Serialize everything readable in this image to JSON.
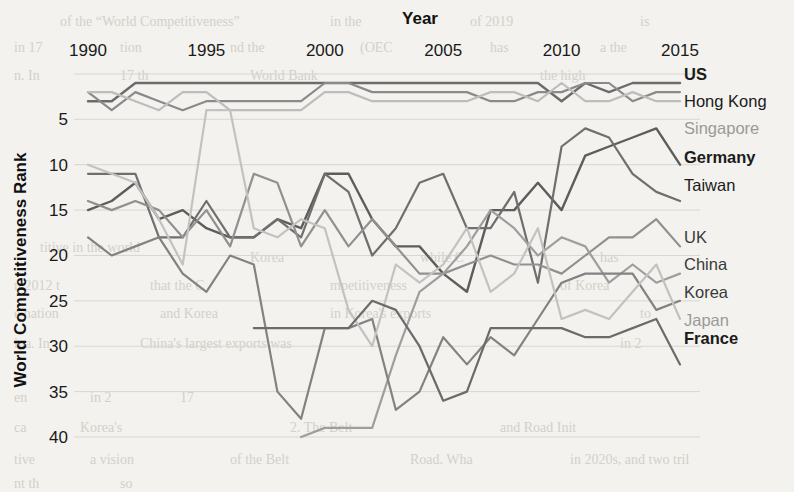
{
  "page": {
    "background_color": "#f3f2ee",
    "bleed_text": [
      {
        "text": "of the “World Competitiveness”",
        "x": 60,
        "y": 14,
        "size": 14
      },
      {
        "text": "in the",
        "x": 330,
        "y": 14,
        "size": 14
      },
      {
        "text": "of 2019",
        "x": 470,
        "y": 14,
        "size": 14
      },
      {
        "text": "is",
        "x": 640,
        "y": 14,
        "size": 14
      },
      {
        "text": "in 17",
        "x": 14,
        "y": 40,
        "size": 14
      },
      {
        "text": "tion",
        "x": 120,
        "y": 40,
        "size": 14
      },
      {
        "text": "nd the",
        "x": 230,
        "y": 40,
        "size": 14
      },
      {
        "text": "(OEC",
        "x": 360,
        "y": 40,
        "size": 14
      },
      {
        "text": "has",
        "x": 490,
        "y": 40,
        "size": 14
      },
      {
        "text": "a the",
        "x": 600,
        "y": 40,
        "size": 14
      },
      {
        "text": "n. In",
        "x": 14,
        "y": 68,
        "size": 14
      },
      {
        "text": "17 th",
        "x": 120,
        "y": 68,
        "size": 14
      },
      {
        "text": "World Bank",
        "x": 250,
        "y": 68,
        "size": 14
      },
      {
        "text": "the high",
        "x": 540,
        "y": 68,
        "size": 14
      },
      {
        "text": "titive in the world",
        "x": 40,
        "y": 240,
        "size": 14
      },
      {
        "text": "Korea",
        "x": 250,
        "y": 250,
        "size": 14
      },
      {
        "text": "while C",
        "x": 420,
        "y": 250,
        "size": 14
      },
      {
        "text": "has",
        "x": 600,
        "y": 250,
        "size": 14
      },
      {
        "text": "n 2012 t",
        "x": 14,
        "y": 278,
        "size": 14
      },
      {
        "text": "that the C",
        "x": 150,
        "y": 278,
        "size": 14
      },
      {
        "text": "mpetitiveness",
        "x": 330,
        "y": 278,
        "size": 14
      },
      {
        "text": "of Korea",
        "x": 560,
        "y": 278,
        "size": 14
      },
      {
        "text": "e nation",
        "x": 14,
        "y": 306,
        "size": 14
      },
      {
        "text": "and Korea",
        "x": 160,
        "y": 306,
        "size": 14
      },
      {
        "text": "in Korea's exports",
        "x": 330,
        "y": 306,
        "size": 14
      },
      {
        "text": "to",
        "x": 640,
        "y": 306,
        "size": 14
      },
      {
        "text": "ina. In",
        "x": 14,
        "y": 336,
        "size": 14
      },
      {
        "text": "China's largest exports was",
        "x": 140,
        "y": 336,
        "size": 14
      },
      {
        "text": "in 2",
        "x": 620,
        "y": 336,
        "size": 14
      },
      {
        "text": "en",
        "x": 14,
        "y": 390,
        "size": 14
      },
      {
        "text": "in 2",
        "x": 90,
        "y": 390,
        "size": 14
      },
      {
        "text": "17",
        "x": 180,
        "y": 390,
        "size": 14
      },
      {
        "text": "ca",
        "x": 14,
        "y": 420,
        "size": 14
      },
      {
        "text": "Korea's",
        "x": 80,
        "y": 420,
        "size": 14
      },
      {
        "text": "2. The Belt",
        "x": 290,
        "y": 420,
        "size": 14
      },
      {
        "text": "and Road Init",
        "x": 500,
        "y": 420,
        "size": 14
      },
      {
        "text": "tive",
        "x": 14,
        "y": 452,
        "size": 14
      },
      {
        "text": "a vision",
        "x": 90,
        "y": 452,
        "size": 14
      },
      {
        "text": "of the Belt",
        "x": 230,
        "y": 452,
        "size": 14
      },
      {
        "text": "Road. Wha",
        "x": 410,
        "y": 452,
        "size": 14
      },
      {
        "text": "in 2020s, and two tril",
        "x": 570,
        "y": 452,
        "size": 14
      },
      {
        "text": "nt th",
        "x": 14,
        "y": 476,
        "size": 14
      },
      {
        "text": "so",
        "x": 120,
        "y": 476,
        "size": 14
      }
    ]
  },
  "chart_data": {
    "type": "line",
    "title": "",
    "xlabel": "Year",
    "ylabel": "World Competitiveness Rank",
    "x_tick_labels": [
      "1990",
      "1995",
      "2000",
      "2005",
      "2010",
      "2015"
    ],
    "x_tick_values": [
      1990,
      1995,
      2000,
      2005,
      2010,
      2015
    ],
    "y_tick_labels": [
      "5",
      "10",
      "15",
      "20",
      "25",
      "30",
      "35",
      "40"
    ],
    "y_tick_values": [
      5,
      10,
      15,
      20,
      25,
      30,
      35,
      40
    ],
    "xlim": [
      1989.5,
      2015.5
    ],
    "ylim": [
      41,
      0
    ],
    "y_axis_inverted": true,
    "grid": true,
    "grid_color": "#d8d6d0",
    "legend_position": "right-of-plot",
    "x": [
      1990,
      1991,
      1992,
      1993,
      1994,
      1995,
      1996,
      1997,
      1998,
      1999,
      2000,
      2001,
      2002,
      2003,
      2004,
      2005,
      2006,
      2007,
      2008,
      2009,
      2010,
      2011,
      2012,
      2013,
      2014,
      2015
    ],
    "series": [
      {
        "name": "US",
        "color": "#6b6b6b",
        "width": 2.4,
        "label_color": "#1b1b1b",
        "label_weight": "bold",
        "values": [
          3,
          3,
          1,
          1,
          1,
          1,
          1,
          1,
          1,
          1,
          1,
          1,
          1,
          1,
          1,
          1,
          1,
          1,
          1,
          1,
          3,
          1,
          2,
          1,
          1,
          1
        ]
      },
      {
        "name": "Hong Kong",
        "color": "#8a8a8a",
        "width": 2.2,
        "label_color": "#1b1b1b",
        "label_weight": "normal",
        "values": [
          2,
          4,
          2,
          3,
          4,
          3,
          3,
          3,
          3,
          3,
          1,
          1,
          2,
          2,
          2,
          2,
          2,
          3,
          3,
          2,
          2,
          1,
          1,
          3,
          2,
          2
        ]
      },
      {
        "name": "Singapore",
        "color": "#bdbdbd",
        "width": 2.2,
        "label_color": "#9a9a9a",
        "label_weight": "normal",
        "values": [
          2,
          2,
          3,
          4,
          2,
          2,
          4,
          4,
          4,
          4,
          2,
          2,
          3,
          3,
          3,
          3,
          3,
          2,
          2,
          3,
          1,
          3,
          3,
          2,
          3,
          3
        ]
      },
      {
        "name": "Germany",
        "color": "#5d5d5d",
        "width": 2.4,
        "label_color": "#1b1b1b",
        "label_weight": "bold",
        "values": [
          15,
          14,
          12,
          16,
          15,
          17,
          18,
          18,
          16,
          17,
          11,
          11,
          16,
          19,
          19,
          22,
          24,
          15,
          15,
          12,
          15,
          9,
          8,
          7,
          6,
          10
        ]
      },
      {
        "name": "Taiwan",
        "color": "#6f6f6f",
        "width": 2.2,
        "label_color": "#1b1b1b",
        "label_weight": "normal",
        "values": [
          11,
          11,
          11,
          18,
          18,
          14,
          18,
          18,
          16,
          18,
          11,
          13,
          20,
          17,
          12,
          11,
          17,
          17,
          13,
          23,
          8,
          6,
          7,
          11,
          13,
          14
        ]
      },
      {
        "name": "UK",
        "color": "#909090",
        "width": 2.2,
        "label_color": "#3a3a3a",
        "label_weight": "normal",
        "values": [
          14,
          15,
          14,
          15,
          18,
          15,
          19,
          11,
          12,
          19,
          15,
          19,
          16,
          19,
          22,
          22,
          21,
          20,
          21,
          21,
          22,
          20,
          18,
          18,
          16,
          19
        ]
      },
      {
        "name": "China",
        "color": "#9e9e9e",
        "width": 2.2,
        "label_color": "#3a3a3a",
        "label_weight": "normal",
        "values": [
          null,
          null,
          null,
          null,
          null,
          null,
          null,
          null,
          null,
          40,
          39,
          39,
          39,
          31,
          24,
          22,
          19,
          15,
          17,
          20,
          18,
          19,
          23,
          21,
          23,
          22
        ]
      },
      {
        "name": "Korea",
        "color": "#828282",
        "width": 2.2,
        "label_color": "#3a3a3a",
        "label_weight": "normal",
        "values": [
          18,
          20,
          19,
          18,
          22,
          24,
          20,
          21,
          35,
          38,
          28,
          28,
          27,
          37,
          35,
          29,
          32,
          29,
          31,
          27,
          23,
          22,
          22,
          22,
          26,
          25
        ]
      },
      {
        "name": "Japan",
        "color": "#c2c2c2",
        "width": 2.2,
        "label_color": "#9a9a9a",
        "label_weight": "normal",
        "values": [
          10,
          11,
          12,
          16,
          21,
          4,
          4,
          17,
          18,
          16,
          17,
          26,
          30,
          21,
          23,
          21,
          17,
          24,
          22,
          17,
          27,
          26,
          27,
          24,
          21,
          27
        ]
      },
      {
        "name": "France",
        "color": "#6b6b6b",
        "width": 2.2,
        "label_color": "#1b1b1b",
        "label_weight": "bold",
        "values": [
          null,
          null,
          null,
          null,
          null,
          null,
          null,
          28,
          28,
          28,
          28,
          28,
          25,
          26,
          30,
          36,
          35,
          28,
          28,
          28,
          28,
          29,
          29,
          28,
          27,
          32
        ]
      }
    ],
    "legend_entries": [
      {
        "label": "US",
        "y": 76
      },
      {
        "label": "Hong Kong",
        "y": 103
      },
      {
        "label": "Singapore",
        "y": 130
      },
      {
        "label": "Germany",
        "y": 159
      },
      {
        "label": "Taiwan",
        "y": 187
      },
      {
        "label": "UK",
        "y": 239
      },
      {
        "label": "China",
        "y": 266
      },
      {
        "label": "Korea",
        "y": 294
      },
      {
        "label": "Japan",
        "y": 322
      },
      {
        "label": "France",
        "y": 340
      }
    ]
  }
}
